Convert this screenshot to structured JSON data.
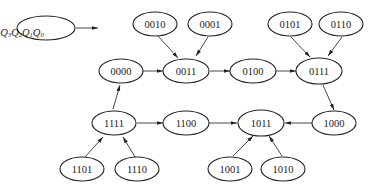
{
  "diagram": {
    "type": "state-transition-diagram",
    "legend": {
      "label": "Q3Q2Q1Q0",
      "parts": [
        {
          "base": "Q",
          "sub": "3"
        },
        {
          "base": "Q",
          "sub": "2"
        },
        {
          "base": "Q",
          "sub": "1"
        },
        {
          "base": "Q",
          "sub": "0"
        }
      ]
    },
    "nodes": [
      {
        "id": "0010",
        "label": "0010"
      },
      {
        "id": "0001",
        "label": "0001"
      },
      {
        "id": "0101",
        "label": "0101"
      },
      {
        "id": "0110",
        "label": "0110"
      },
      {
        "id": "0000",
        "label": "0000"
      },
      {
        "id": "0011",
        "label": "0011"
      },
      {
        "id": "0100",
        "label": "0100"
      },
      {
        "id": "0111",
        "label": "0111"
      },
      {
        "id": "1111",
        "label": "1111"
      },
      {
        "id": "1100",
        "label": "1100"
      },
      {
        "id": "1011",
        "label": "1011"
      },
      {
        "id": "1000",
        "label": "1000"
      },
      {
        "id": "1101",
        "label": "1101"
      },
      {
        "id": "1110",
        "label": "1110"
      },
      {
        "id": "1001",
        "label": "1001"
      },
      {
        "id": "1010",
        "label": "1010"
      }
    ],
    "edges": [
      {
        "from": "0010",
        "to": "0011"
      },
      {
        "from": "0001",
        "to": "0011"
      },
      {
        "from": "0000",
        "to": "0011"
      },
      {
        "from": "0011",
        "to": "0100"
      },
      {
        "from": "0100",
        "to": "0111"
      },
      {
        "from": "0101",
        "to": "0111"
      },
      {
        "from": "0110",
        "to": "0111"
      },
      {
        "from": "0111",
        "to": "1000"
      },
      {
        "from": "1000",
        "to": "1011"
      },
      {
        "from": "1001",
        "to": "1011"
      },
      {
        "from": "1010",
        "to": "1011"
      },
      {
        "from": "1100",
        "to": "1011"
      },
      {
        "from": "1111",
        "to": "1100"
      },
      {
        "from": "1111",
        "to": "0000"
      },
      {
        "from": "1101",
        "to": "1111"
      },
      {
        "from": "1110",
        "to": "1111"
      }
    ]
  }
}
